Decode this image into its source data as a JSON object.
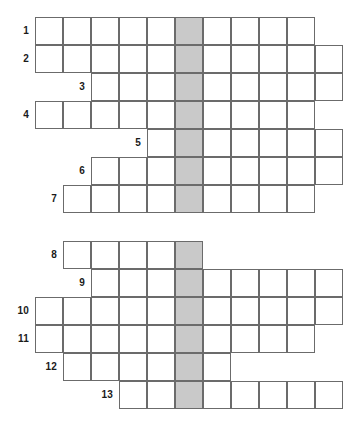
{
  "puzzle": {
    "title": "Crossword grid",
    "type": "crossword",
    "cell_size": 28,
    "origin_x": 35,
    "origin_y": 17,
    "shaded_column": 6,
    "shaded_color": "#c9c9c9",
    "grid_line_color": "#6b6b6b",
    "cell_color": "#ffffff",
    "background_color": "#ffffff",
    "label_color": "#1a1a1a",
    "rows": [
      {
        "number": "1",
        "start_col": 1,
        "end_col": 10
      },
      {
        "number": "2",
        "start_col": 1,
        "end_col": 11
      },
      {
        "number": "3",
        "start_col": 3,
        "end_col": 11
      },
      {
        "number": "4",
        "start_col": 1,
        "end_col": 10
      },
      {
        "number": "5",
        "start_col": 5,
        "end_col": 11
      },
      {
        "number": "6",
        "start_col": 3,
        "end_col": 11
      },
      {
        "number": "7",
        "start_col": 2,
        "end_col": 10
      },
      {
        "number": "",
        "start_col": 0,
        "end_col": 0
      },
      {
        "number": "8",
        "start_col": 2,
        "end_col": 6
      },
      {
        "number": "9",
        "start_col": 3,
        "end_col": 11
      },
      {
        "number": "10",
        "start_col": 1,
        "end_col": 11
      },
      {
        "number": "11",
        "start_col": 1,
        "end_col": 10
      },
      {
        "number": "12",
        "start_col": 2,
        "end_col": 7
      },
      {
        "number": "13",
        "start_col": 4,
        "end_col": 11
      }
    ]
  }
}
